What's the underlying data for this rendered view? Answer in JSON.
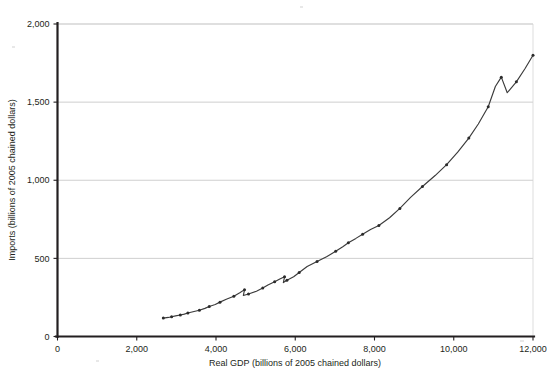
{
  "chart_data": {
    "type": "line",
    "title": "",
    "xlabel": "Real GDP (billions of 2005 chained dollars)",
    "ylabel": "Imports (billions of 2005 chained dollars)",
    "xlim": [
      0,
      12000
    ],
    "ylim": [
      0,
      2000
    ],
    "xticks": [
      0,
      2000,
      4000,
      6000,
      8000,
      10000,
      12000
    ],
    "xtick_labels": [
      "0",
      "2,000",
      "4,000",
      "6,000",
      "8,000",
      "10,000",
      "12,000"
    ],
    "yticks": [
      0,
      500,
      1000,
      1500,
      2000
    ],
    "ytick_labels": [
      "0",
      "500",
      "1,000",
      "1,500",
      "2,000"
    ],
    "grid": "horizontal",
    "legend": "none",
    "marker": "filled-circle",
    "series": [
      {
        "name": "Imports vs Real GDP",
        "x": [
          2670,
          2800,
          2880,
          2980,
          3100,
          3200,
          3290,
          3420,
          3580,
          3720,
          3830,
          3980,
          4100,
          4260,
          4450,
          4600,
          4720,
          4690,
          4820,
          5020,
          5180,
          5310,
          5480,
          5610,
          5730,
          5700,
          5790,
          5960,
          6100,
          6300,
          6550,
          6790,
          7020,
          7200,
          7340,
          7530,
          7700,
          7900,
          8110,
          8380,
          8640,
          8910,
          9210,
          9530,
          9820,
          10100,
          10380,
          10620,
          10870,
          11050,
          11200,
          11350,
          11580,
          11800,
          12000
        ],
        "y": [
          118,
          122,
          126,
          132,
          138,
          143,
          150,
          158,
          168,
          180,
          192,
          205,
          220,
          238,
          258,
          280,
          300,
          262,
          272,
          290,
          310,
          330,
          350,
          368,
          382,
          345,
          360,
          382,
          410,
          448,
          480,
          510,
          545,
          575,
          600,
          628,
          655,
          685,
          710,
          760,
          820,
          890,
          960,
          1030,
          1100,
          1180,
          1270,
          1360,
          1470,
          1600,
          1660,
          1560,
          1630,
          1715,
          1800
        ]
      }
    ],
    "notes": {
      "recession_dips": [
        "early-1980s dip near GDP 4,700",
        "1990-91 dip near GDP 5,700",
        "2008-09 dip near GDP 11,200"
      ]
    }
  },
  "axes": {
    "x_title": "Real GDP (billions of 2005 chained dollars)",
    "y_title": "Imports (billions of 2005 chained dollars)"
  }
}
